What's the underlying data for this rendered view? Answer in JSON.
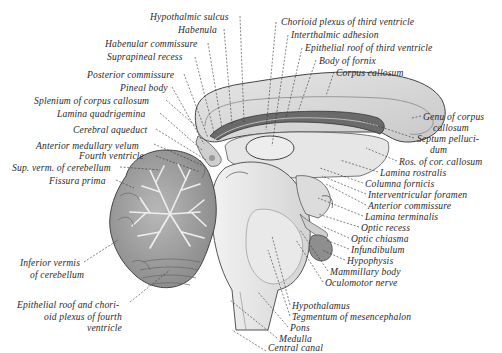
{
  "figure": {
    "caption": "",
    "labels_left": [
      {
        "id": "hypothalmic-sulcus",
        "text": "Hypothalmic sulcus",
        "x": 150,
        "y": 12
      },
      {
        "id": "habenula",
        "text": "Habenula",
        "x": 178,
        "y": 25
      },
      {
        "id": "habenular-commissure",
        "text": "Habenular commissure",
        "x": 105,
        "y": 39
      },
      {
        "id": "suprapineal-recess",
        "text": "Suprapineal recess",
        "x": 107,
        "y": 52
      },
      {
        "id": "posterior-commissure",
        "text": "Posterior commissure",
        "x": 87,
        "y": 70
      },
      {
        "id": "pineal-body",
        "text": "Pineal body",
        "x": 120,
        "y": 83
      },
      {
        "id": "splenium-of-corpus-callosum",
        "text": "Splenium of corpus callosum",
        "x": 34,
        "y": 96
      },
      {
        "id": "lamina-quadrigemina",
        "text": "Lamina quadrigemina",
        "x": 57,
        "y": 109
      },
      {
        "id": "cerebral-aqueduct",
        "text": "Cerebral aqueduct",
        "x": 73,
        "y": 125
      },
      {
        "id": "anterior-medullary-velum",
        "text": "Anterior medullary velum",
        "x": 36,
        "y": 141
      },
      {
        "id": "fourth-ventricle",
        "text": "Fourth ventricle",
        "x": 79,
        "y": 151
      },
      {
        "id": "sup-verm-of-cerebellum",
        "text": "Sup. verm. of cerebellum",
        "x": 12,
        "y": 163
      },
      {
        "id": "fissura-prima",
        "text": "Fissura prima",
        "x": 49,
        "y": 176
      },
      {
        "id": "inferior-vermis-line1",
        "text": "Inferior vermis",
        "x": 20,
        "y": 258
      },
      {
        "id": "inferior-vermis-line2",
        "text": "of cerebellum",
        "x": 30,
        "y": 270
      },
      {
        "id": "epithelial-roof-fourth-line1",
        "text": "Epithelial roof and chori-",
        "x": 17,
        "y": 300
      },
      {
        "id": "epithelial-roof-fourth-line2",
        "text": "oid plexus of fourth",
        "x": 44,
        "y": 312
      },
      {
        "id": "epithelial-roof-fourth-line3",
        "text": "ventricle",
        "x": 87,
        "y": 323
      }
    ],
    "labels_right": [
      {
        "id": "chorioid-plexus-third-ventricle",
        "text": "Chorioid plexus of third ventricle",
        "x": 281,
        "y": 17
      },
      {
        "id": "interthalmic-adhesion",
        "text": "Interthalmic adhesion",
        "x": 291,
        "y": 30
      },
      {
        "id": "epithelial-roof-third-ventricle",
        "text": "Epithelial roof of third ventricle",
        "x": 305,
        "y": 43
      },
      {
        "id": "body-of-fornix",
        "text": "Body of fornix",
        "x": 319,
        "y": 56
      },
      {
        "id": "corpus-callosum",
        "text": "Corpus callosum",
        "x": 336,
        "y": 68
      },
      {
        "id": "genu-of-corpus-callosum-line1",
        "text": "Genu of corpus",
        "x": 423,
        "y": 112
      },
      {
        "id": "genu-of-corpus-callosum-line2",
        "text": "callosum",
        "x": 433,
        "y": 123
      },
      {
        "id": "septum-pellucidum-line1",
        "text": "Septum pelluci-",
        "x": 417,
        "y": 134
      },
      {
        "id": "septum-pellucidum-line2",
        "text": "dum",
        "x": 430,
        "y": 145
      },
      {
        "id": "ros-of-cor-callosum",
        "text": "Ros. of cor. callosum",
        "x": 399,
        "y": 157
      },
      {
        "id": "lamina-rostralis",
        "text": "Lamina rostralis",
        "x": 380,
        "y": 168
      },
      {
        "id": "columna-fornicis",
        "text": "Columna fornicis",
        "x": 365,
        "y": 179
      },
      {
        "id": "interventricular-foramen",
        "text": "Interventricular foramen",
        "x": 368,
        "y": 190
      },
      {
        "id": "anterior-commissure",
        "text": "Anterior commissure",
        "x": 368,
        "y": 201
      },
      {
        "id": "lamina-terminalis",
        "text": "Lamina terminalis",
        "x": 365,
        "y": 212
      },
      {
        "id": "optic-recess",
        "text": "Optic recess",
        "x": 361,
        "y": 223
      },
      {
        "id": "optic-chiasma",
        "text": "Optic chiasma",
        "x": 351,
        "y": 234
      },
      {
        "id": "infundibulum",
        "text": "Infundibulum",
        "x": 351,
        "y": 245
      },
      {
        "id": "hypophysis",
        "text": "Hypophysis",
        "x": 347,
        "y": 256
      },
      {
        "id": "mammillary-body",
        "text": "Mammillary body",
        "x": 330,
        "y": 267
      },
      {
        "id": "oculomotor-nerve",
        "text": "Oculomotor nerve",
        "x": 325,
        "y": 278
      },
      {
        "id": "hypothalamus",
        "text": "Hypothalamus",
        "x": 292,
        "y": 301
      },
      {
        "id": "tegmentum-of-mesencephalon",
        "text": "Tegmentum of mesencephalon",
        "x": 292,
        "y": 312
      },
      {
        "id": "pons",
        "text": "Pons",
        "x": 290,
        "y": 323
      },
      {
        "id": "medulla",
        "text": "Medulla",
        "x": 279,
        "y": 334
      },
      {
        "id": "central-canal",
        "text": "Central canal",
        "x": 268,
        "y": 347
      }
    ]
  },
  "colors": {
    "ink": "#2a2a2a",
    "cerebrum_fill": "#d9d9d9",
    "cerebrum_light": "#e8e8e8",
    "cerebellum_fill": "#a8a8a8",
    "cerebellum_dark": "#6f6f6f",
    "brainstem_fill": "#e2e2e2",
    "hypophysis_fill": "#8e8e8e",
    "choroid_dark": "#4a4a4a"
  }
}
